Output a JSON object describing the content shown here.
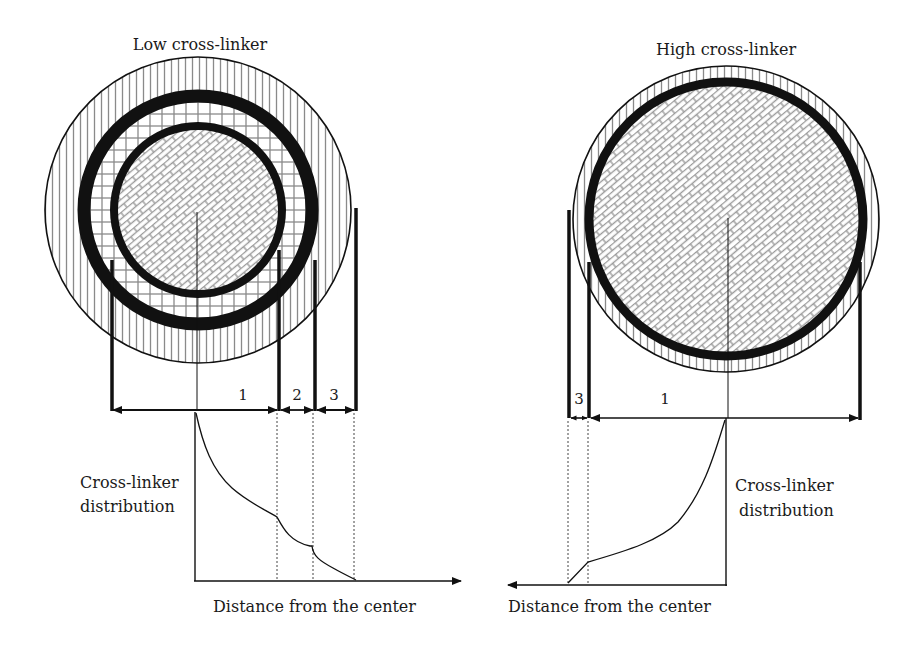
{
  "left_panel": {
    "title": "Low cross-linker",
    "zones": [
      "1",
      "2",
      "3"
    ],
    "y_label_line1": "Cross-linker",
    "y_label_line2": "distribution",
    "x_label": "Distance from the center"
  },
  "right_panel": {
    "title": "High cross-linker",
    "zones": [
      "3",
      "1"
    ],
    "y_label_line1": "Cross-linker",
    "y_label_line2": "distribution",
    "x_label": "Distance from the center"
  },
  "colors": {
    "ink": "#111111",
    "hatch": "#8a8a8a",
    "background": "#ffffff"
  }
}
